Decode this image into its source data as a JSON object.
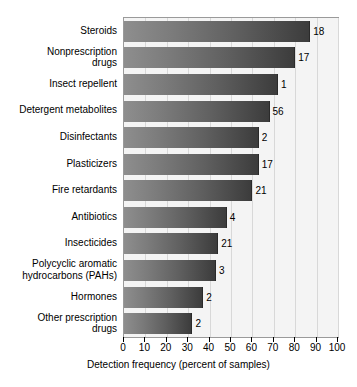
{
  "chart_data": {
    "type": "bar",
    "orientation": "horizontal",
    "title": "",
    "xlabel": "Detection frequency (percent of samples)",
    "ylabel": "",
    "xlim": [
      0,
      100
    ],
    "xticks": [
      0,
      10,
      20,
      30,
      40,
      50,
      60,
      70,
      80,
      90,
      100
    ],
    "xtick_labels": [
      "0",
      "10",
      "20",
      "30",
      "40",
      "50",
      "60",
      "70",
      "80",
      "90",
      "100"
    ],
    "grid": true,
    "legend": "none",
    "categories": [
      "Steroids",
      "Nonprescription\ndrugs",
      "Insect repellent",
      "Detergent metabolites",
      "Disinfectants",
      "Plasticizers",
      "Fire retardants",
      "Antibiotics",
      "Insecticides",
      "Polycyclic aromatic\nhydrocarbons (PAHs)",
      "Hormones",
      "Other prescription\ndrugs"
    ],
    "values": [
      87,
      80,
      72,
      68,
      63,
      63,
      60,
      48,
      44,
      43,
      37,
      32
    ],
    "point_labels": [
      "18",
      "17",
      "1",
      "56",
      "2",
      "17",
      "21",
      "4",
      "21",
      "3",
      "2",
      "2"
    ],
    "point_label_note": "number of compounds measured, printed at each bar end",
    "colors": {
      "bar_light": "#8e8e8e",
      "bar_dark": "#3c3c3c",
      "plot_background": "#f4f4f4",
      "gridline": "#d8d8d8",
      "frame": "#9a9a9a",
      "text": "#000000"
    }
  }
}
